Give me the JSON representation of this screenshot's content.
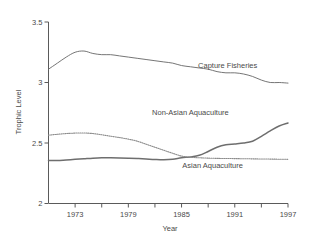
{
  "chart_data": {
    "type": "line",
    "title": "",
    "xlabel": "Year",
    "ylabel": "Trophic Level",
    "xlim": [
      1970,
      1997
    ],
    "ylim": [
      2.0,
      3.5
    ],
    "grid": false,
    "legend_position": "inline-labels",
    "x_tick_labels": [
      "1973",
      "1979",
      "1985",
      "1991",
      "1997"
    ],
    "x_tick_values": [
      1973,
      1979,
      1985,
      1991,
      1997
    ],
    "x_minor_tick_values": [
      1976,
      1982,
      1988,
      1994
    ],
    "y_tick_labels": [
      "2",
      "2.5",
      "3",
      "3.5"
    ],
    "y_tick_values": [
      2,
      2.5,
      3,
      3.5
    ],
    "x": [
      1970,
      1971,
      1972,
      1973,
      1974,
      1975,
      1976,
      1977,
      1978,
      1979,
      1980,
      1981,
      1982,
      1983,
      1984,
      1985,
      1986,
      1987,
      1988,
      1989,
      1990,
      1991,
      1992,
      1993,
      1994,
      1995,
      1996,
      1997
    ],
    "series": [
      {
        "name": "Capture Fisheries",
        "style": "solid-thin",
        "color": "#6e6e6e",
        "label_x": 1990.2,
        "label_y": 3.12,
        "values": [
          3.11,
          3.16,
          3.21,
          3.25,
          3.26,
          3.24,
          3.23,
          3.23,
          3.22,
          3.21,
          3.2,
          3.19,
          3.18,
          3.17,
          3.16,
          3.14,
          3.13,
          3.12,
          3.11,
          3.09,
          3.08,
          3.08,
          3.07,
          3.05,
          3.02,
          3.0,
          3.0,
          2.995
        ]
      },
      {
        "name": "Non-Asian Aquaculture",
        "style": "solid-thick",
        "color": "#6e6e6e",
        "label_x": 1986.0,
        "label_y": 2.73,
        "values": [
          2.355,
          2.355,
          2.36,
          2.365,
          2.37,
          2.375,
          2.378,
          2.378,
          2.377,
          2.375,
          2.372,
          2.368,
          2.364,
          2.362,
          2.366,
          2.378,
          2.385,
          2.398,
          2.43,
          2.465,
          2.485,
          2.492,
          2.5,
          2.515,
          2.555,
          2.6,
          2.64,
          2.665
        ]
      },
      {
        "name": "Asian Aquaculture",
        "style": "dotted",
        "color": "#8c8c8c",
        "label_x": 1988.5,
        "label_y": 2.29,
        "values": [
          2.565,
          2.572,
          2.578,
          2.582,
          2.583,
          2.578,
          2.568,
          2.556,
          2.545,
          2.532,
          2.515,
          2.49,
          2.465,
          2.44,
          2.415,
          2.392,
          2.382,
          2.378,
          2.375,
          2.373,
          2.372,
          2.371,
          2.37,
          2.369,
          2.368,
          2.367,
          2.366,
          2.365
        ]
      }
    ]
  }
}
